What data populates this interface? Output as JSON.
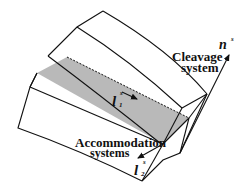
{
  "figure": {
    "type": "3D crystal cleavage schematic",
    "labels": {
      "cleavage_system_line1": "Cleavage",
      "cleavage_system_line2": "system",
      "accommodation_line1": "Accommodation",
      "accommodation_line2": "systems"
    },
    "vectors": {
      "normal": {
        "symbol": "n",
        "superscript": "s"
      },
      "l1": {
        "symbol": "l",
        "subscript": "1",
        "superscript": "s"
      },
      "l2": {
        "symbol": "l",
        "subscript": "2",
        "superscript": "s"
      }
    },
    "colors": {
      "line": "#111111",
      "cleavage_plane_fill": "#b9b9b9",
      "background": "#ffffff"
    }
  }
}
